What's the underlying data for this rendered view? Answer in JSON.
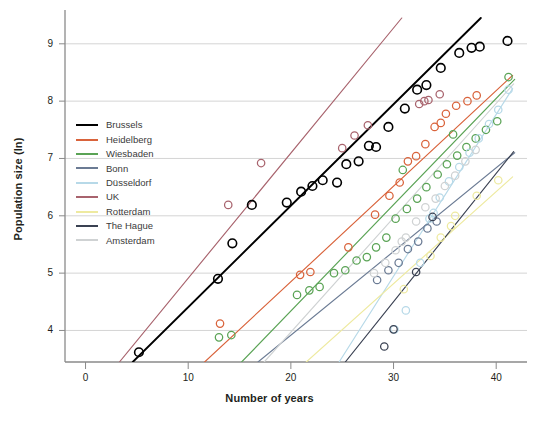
{
  "chart_data": {
    "type": "scatter",
    "title": "",
    "xlabel": "Number of years",
    "ylabel": "Population size (ln)",
    "xlim": [
      -2,
      43
    ],
    "ylim": [
      3.45,
      9.45
    ],
    "xticks": [
      0,
      10,
      20,
      30,
      40
    ],
    "yticks": [
      4,
      5,
      6,
      7,
      8,
      9
    ],
    "grid": "horizontal",
    "legend_position": "upper-left-inside",
    "marker": "open-circle",
    "series": [
      {
        "name": "Brussels",
        "color": "#000000",
        "points": [
          [
            5.2,
            3.62
          ],
          [
            12.9,
            4.9
          ],
          [
            14.3,
            5.52
          ],
          [
            16.2,
            6.19
          ],
          [
            19.6,
            6.23
          ],
          [
            21.0,
            6.42
          ],
          [
            22.1,
            6.52
          ],
          [
            23.1,
            6.62
          ],
          [
            24.5,
            6.58
          ],
          [
            25.4,
            6.9
          ],
          [
            26.6,
            6.95
          ],
          [
            27.6,
            7.22
          ],
          [
            28.3,
            7.2
          ],
          [
            29.5,
            7.55
          ],
          [
            31.1,
            7.87
          ],
          [
            32.3,
            8.2
          ],
          [
            33.2,
            8.28
          ],
          [
            34.6,
            8.58
          ],
          [
            36.4,
            8.84
          ],
          [
            37.6,
            8.93
          ],
          [
            38.4,
            8.95
          ],
          [
            41.1,
            9.05
          ]
        ],
        "line": {
          "x0": 4.6,
          "y0": 3.45,
          "x1": 38.5,
          "y1": 9.45
        }
      },
      {
        "name": "Heidelberg",
        "color": "#d9633b",
        "points": [
          [
            13.1,
            4.12
          ],
          [
            20.9,
            4.97
          ],
          [
            21.9,
            5.02
          ],
          [
            25.6,
            5.45
          ],
          [
            28.2,
            6.02
          ],
          [
            29.6,
            6.35
          ],
          [
            30.6,
            6.58
          ],
          [
            31.4,
            6.95
          ],
          [
            33.1,
            7.25
          ],
          [
            34.0,
            7.55
          ],
          [
            35.1,
            7.78
          ],
          [
            36.1,
            7.92
          ],
          [
            37.2,
            8.0
          ],
          [
            38.1,
            8.1
          ],
          [
            34.6,
            7.62
          ],
          [
            32.2,
            7.04
          ]
        ],
        "line": {
          "x0": 11.6,
          "y0": 3.45,
          "x1": 41.6,
          "y1": 8.45
        }
      },
      {
        "name": "Wiesbaden",
        "color": "#5aa355",
        "points": [
          [
            13.0,
            3.88
          ],
          [
            14.2,
            3.92
          ],
          [
            20.6,
            4.62
          ],
          [
            21.8,
            4.7
          ],
          [
            22.8,
            4.76
          ],
          [
            24.2,
            5.0
          ],
          [
            25.3,
            5.05
          ],
          [
            26.4,
            5.22
          ],
          [
            27.4,
            5.28
          ],
          [
            28.3,
            5.45
          ],
          [
            29.3,
            5.62
          ],
          [
            30.2,
            5.95
          ],
          [
            31.3,
            6.12
          ],
          [
            32.3,
            6.3
          ],
          [
            33.2,
            6.5
          ],
          [
            34.3,
            6.72
          ],
          [
            35.2,
            6.9
          ],
          [
            36.2,
            7.05
          ],
          [
            37.1,
            7.2
          ],
          [
            38.0,
            7.35
          ],
          [
            39.0,
            7.5
          ],
          [
            40.1,
            7.65
          ],
          [
            41.2,
            8.42
          ],
          [
            30.9,
            6.8
          ],
          [
            35.8,
            7.42
          ]
        ],
        "line": {
          "x0": 15.2,
          "y0": 3.45,
          "x1": 41.8,
          "y1": 8.38
        }
      },
      {
        "name": "Bonn",
        "color": "#6b7b94",
        "points": [
          [
            29.5,
            5.05
          ],
          [
            30.5,
            5.18
          ],
          [
            31.4,
            5.42
          ],
          [
            32.4,
            5.55
          ],
          [
            33.3,
            5.78
          ],
          [
            34.2,
            5.9
          ],
          [
            28.4,
            4.88
          ]
        ],
        "line": {
          "x0": 16.8,
          "y0": 3.45,
          "x1": 41.8,
          "y1": 7.1
        }
      },
      {
        "name": "Düsseldorf",
        "color": "#b7d9e8",
        "points": [
          [
            30.1,
            4.02
          ],
          [
            31.2,
            4.35
          ],
          [
            32.6,
            5.18
          ],
          [
            33.5,
            5.95
          ],
          [
            34.5,
            6.32
          ],
          [
            35.4,
            6.6
          ],
          [
            36.4,
            6.85
          ],
          [
            37.4,
            7.1
          ],
          [
            38.3,
            7.35
          ],
          [
            39.3,
            7.6
          ],
          [
            40.2,
            7.85
          ],
          [
            41.2,
            8.2
          ],
          [
            33.9,
            6.05
          ]
        ],
        "line": {
          "x0": 24.7,
          "y0": 3.45,
          "x1": 41.6,
          "y1": 8.22
        }
      },
      {
        "name": "UK",
        "color": "#a8636d",
        "points": [
          [
            13.9,
            6.19
          ],
          [
            17.1,
            6.92
          ],
          [
            25.0,
            7.18
          ],
          [
            26.2,
            7.4
          ],
          [
            27.5,
            7.58
          ],
          [
            32.5,
            7.95
          ],
          [
            33.4,
            8.02
          ],
          [
            34.5,
            8.12
          ],
          [
            33.0,
            8.0
          ]
        ],
        "line": {
          "x0": 3.3,
          "y0": 3.45,
          "x1": 30.8,
          "y1": 9.45
        }
      },
      {
        "name": "Rotterdam",
        "color": "#eeeaa0",
        "points": [
          [
            31.0,
            4.72
          ],
          [
            33.6,
            5.3
          ],
          [
            34.6,
            5.62
          ],
          [
            36.0,
            6.0
          ],
          [
            38.1,
            6.35
          ],
          [
            40.2,
            6.62
          ],
          [
            35.6,
            5.82
          ]
        ],
        "line": {
          "x0": 21.5,
          "y0": 3.45,
          "x1": 41.6,
          "y1": 6.68
        }
      },
      {
        "name": "The Hague",
        "color": "#3a4152",
        "points": [
          [
            30.0,
            4.02
          ],
          [
            32.2,
            5.02
          ],
          [
            33.8,
            5.98
          ],
          [
            29.1,
            3.72
          ]
        ],
        "line": {
          "x0": 25.3,
          "y0": 3.45,
          "x1": 41.7,
          "y1": 7.12
        }
      },
      {
        "name": "Amsterdam",
        "color": "#cfd2d3",
        "points": [
          [
            28.1,
            5.0
          ],
          [
            29.2,
            5.18
          ],
          [
            30.2,
            5.4
          ],
          [
            31.2,
            5.62
          ],
          [
            32.2,
            5.9
          ],
          [
            33.1,
            6.15
          ],
          [
            34.1,
            6.3
          ],
          [
            35.0,
            6.52
          ],
          [
            36.0,
            6.7
          ],
          [
            37.0,
            6.95
          ],
          [
            38.0,
            7.15
          ],
          [
            30.8,
            5.55
          ]
        ],
        "line": {
          "x0": 17.4,
          "y0": 3.45,
          "x1": 41.7,
          "y1": 8.3
        }
      }
    ]
  },
  "legend": {
    "items": [
      {
        "label": "Brussels",
        "color": "#000000"
      },
      {
        "label": "Heidelberg",
        "color": "#d9633b"
      },
      {
        "label": "Wiesbaden",
        "color": "#5aa355"
      },
      {
        "label": "Bonn",
        "color": "#6b7b94"
      },
      {
        "label": "Düsseldorf",
        "color": "#b7d9e8"
      },
      {
        "label": "UK",
        "color": "#a8636d"
      },
      {
        "label": "Rotterdam",
        "color": "#eeeaa0"
      },
      {
        "label": "The Hague",
        "color": "#3a4152"
      },
      {
        "label": "Amsterdam",
        "color": "#cfd2d3"
      }
    ]
  },
  "axes": {
    "x_title": "Number of years",
    "y_title": "Population size (ln)",
    "x_tick_labels": [
      "0",
      "10",
      "20",
      "30",
      "40"
    ],
    "y_tick_labels": [
      "4",
      "5",
      "6",
      "7",
      "8",
      "9"
    ]
  }
}
